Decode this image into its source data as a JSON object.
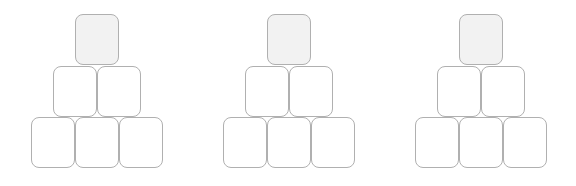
{
  "scene": {
    "title": "Block pyramid set",
    "background_color": "#ffffff",
    "block_count_total": 18
  },
  "block_style": {
    "empty_fill": "#ffffff",
    "filled_fill": "#f2f2f2",
    "border_color": "#b0b0b0",
    "corner_radius_px": 8,
    "block_width_px": 44,
    "block_height_px": 51
  },
  "pyramids": [
    {
      "name": "pyramid-1",
      "left_px": 31,
      "rows": [
        {
          "name": "top-row",
          "count": 1,
          "blocks": [
            {
              "state": "filled"
            }
          ]
        },
        {
          "name": "middle-row",
          "count": 2,
          "blocks": [
            {
              "state": "empty"
            },
            {
              "state": "empty"
            }
          ]
        },
        {
          "name": "bottom-row",
          "count": 3,
          "blocks": [
            {
              "state": "empty"
            },
            {
              "state": "empty"
            },
            {
              "state": "empty"
            }
          ]
        }
      ]
    },
    {
      "name": "pyramid-2",
      "left_px": 223,
      "rows": [
        {
          "name": "top-row",
          "count": 1,
          "blocks": [
            {
              "state": "filled"
            }
          ]
        },
        {
          "name": "middle-row",
          "count": 2,
          "blocks": [
            {
              "state": "empty"
            },
            {
              "state": "empty"
            }
          ]
        },
        {
          "name": "bottom-row",
          "count": 3,
          "blocks": [
            {
              "state": "empty"
            },
            {
              "state": "empty"
            },
            {
              "state": "empty"
            }
          ]
        }
      ]
    },
    {
      "name": "pyramid-3",
      "left_px": 415,
      "rows": [
        {
          "name": "top-row",
          "count": 1,
          "blocks": [
            {
              "state": "filled"
            }
          ]
        },
        {
          "name": "middle-row",
          "count": 2,
          "blocks": [
            {
              "state": "empty"
            },
            {
              "state": "empty"
            }
          ]
        },
        {
          "name": "bottom-row",
          "count": 3,
          "blocks": [
            {
              "state": "empty"
            },
            {
              "state": "empty"
            },
            {
              "state": "empty"
            }
          ]
        }
      ]
    }
  ]
}
